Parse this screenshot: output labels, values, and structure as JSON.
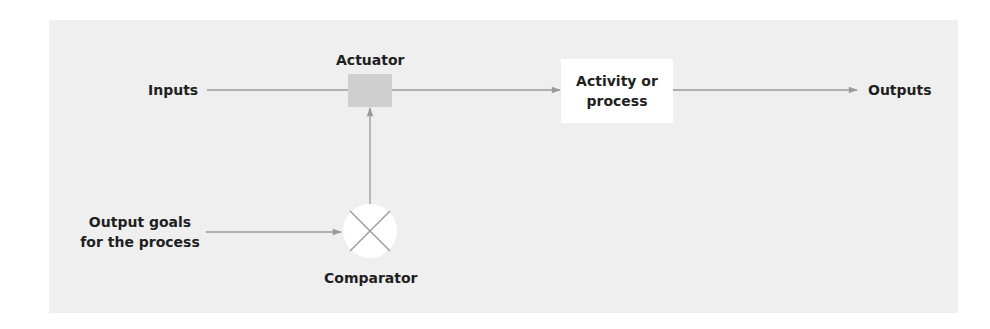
{
  "diagram": {
    "type": "control-loop",
    "nodes": {
      "inputs": {
        "label": "Inputs"
      },
      "actuator": {
        "label": "Actuator"
      },
      "activity": {
        "label_line1": "Activity or",
        "label_line2": "process"
      },
      "outputs": {
        "label": "Outputs"
      },
      "goals": {
        "label_line1": "Output goals",
        "label_line2": "for the process"
      },
      "comparator": {
        "label": "Comparator",
        "icon": "cross-circle-icon"
      }
    },
    "edges": [
      {
        "from": "inputs",
        "to": "actuator",
        "arrow": false
      },
      {
        "from": "actuator",
        "to": "activity",
        "arrow": true
      },
      {
        "from": "activity",
        "to": "outputs",
        "arrow": true
      },
      {
        "from": "goals",
        "to": "comparator",
        "arrow": true
      },
      {
        "from": "comparator",
        "to": "actuator",
        "arrow": true
      }
    ],
    "colors": {
      "panel": "#efefef",
      "actuator_fill": "#cfcfcf",
      "box_fill": "#ffffff",
      "line": "#9a9a9a",
      "text": "#1f1f1f"
    }
  }
}
